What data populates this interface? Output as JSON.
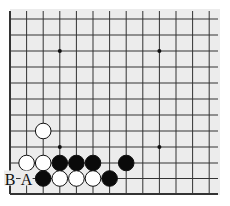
{
  "board": {
    "background": "#ececec",
    "line_color": "#333333",
    "cols": [
      10,
      26.6,
      43.2,
      59.8,
      76.4,
      93,
      109.6,
      126.2,
      142.8,
      159.4,
      176,
      192.6,
      209.2
    ],
    "rows": [
      19,
      35,
      51,
      67,
      83,
      99,
      115,
      131,
      147,
      163,
      178.5,
      194
    ],
    "left_edge": true,
    "bottom_edge": true,
    "star_points": [
      [
        3,
        2
      ],
      [
        9,
        2
      ],
      [
        3,
        8
      ],
      [
        9,
        8
      ]
    ]
  },
  "stones": [
    {
      "color": "white",
      "col": 2,
      "row": 7
    },
    {
      "color": "white",
      "col": 1,
      "row": 9
    },
    {
      "color": "white",
      "col": 2,
      "row": 9
    },
    {
      "color": "black",
      "col": 3,
      "row": 9
    },
    {
      "color": "black",
      "col": 4,
      "row": 9
    },
    {
      "color": "black",
      "col": 5,
      "row": 9
    },
    {
      "color": "black",
      "col": 7,
      "row": 9
    },
    {
      "color": "black",
      "col": 2,
      "row": 10
    },
    {
      "color": "white",
      "col": 3,
      "row": 10
    },
    {
      "color": "white",
      "col": 4,
      "row": 10
    },
    {
      "color": "white",
      "col": 5,
      "row": 10
    },
    {
      "color": "black",
      "col": 6,
      "row": 10
    }
  ],
  "labels": [
    {
      "text": "B",
      "col": 0,
      "row": 10
    },
    {
      "text": "A",
      "col": 1,
      "row": 10
    }
  ]
}
